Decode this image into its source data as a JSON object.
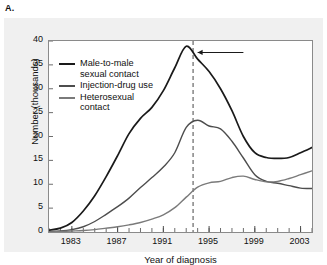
{
  "panel": {
    "label": "A."
  },
  "chart_data": {
    "type": "line",
    "title": "",
    "xlabel": "Year of diagnosis",
    "ylabel": "Number (thousands)",
    "xlim": [
      1981,
      2004
    ],
    "ylim": [
      0,
      40
    ],
    "yticks": [
      0,
      5,
      10,
      15,
      20,
      25,
      30,
      35,
      40
    ],
    "xticks_major": [
      1983,
      1987,
      1991,
      1995,
      1999,
      2003
    ],
    "xticks_minor_step": 1,
    "grid": false,
    "legend_position": "upper-left",
    "x": [
      1981,
      1982,
      1983,
      1984,
      1985,
      1986,
      1987,
      1988,
      1989,
      1990,
      1991,
      1992,
      1993,
      1994,
      1995,
      1996,
      1997,
      1998,
      1999,
      2000,
      2001,
      2002,
      2003,
      2004
    ],
    "series": [
      {
        "name": "Male-to-male sexual contact",
        "color": "#1a1a1a",
        "values": [
          0.4,
          0.8,
          2.0,
          4.4,
          7.6,
          11.6,
          16.0,
          20.6,
          23.8,
          26.1,
          29.6,
          34.4,
          38.9,
          36.2,
          33.6,
          30.0,
          25.4,
          20.0,
          16.6,
          15.6,
          15.4,
          15.6,
          16.6,
          17.7
        ]
      },
      {
        "name": "Injection-drug use",
        "color": "#4d4d4d",
        "values": [
          0.1,
          0.2,
          0.5,
          1.1,
          2.2,
          3.7,
          5.3,
          7.1,
          9.3,
          11.4,
          13.6,
          16.6,
          21.9,
          23.4,
          22.2,
          21.6,
          19.0,
          15.5,
          12.0,
          10.6,
          10.2,
          9.7,
          9.2,
          9.1
        ]
      },
      {
        "name": "Heterosexual contact",
        "color": "#7a7a7a",
        "values": [
          0.0,
          0.1,
          0.2,
          0.3,
          0.5,
          0.8,
          1.1,
          1.5,
          2.0,
          2.7,
          3.6,
          5.1,
          7.3,
          9.4,
          10.3,
          10.6,
          11.4,
          11.7,
          11.0,
          10.5,
          10.6,
          11.2,
          12.0,
          12.8
        ]
      }
    ],
    "annotations": [
      {
        "type": "vertical-dashed-line",
        "x": 1993.6,
        "color": "#666666"
      },
      {
        "type": "arrow",
        "direction": "left",
        "x_from": 1998.0,
        "x_to": 1994.0,
        "y": 37.6,
        "color": "#1a1a1a"
      }
    ]
  },
  "legend": {
    "entries": [
      {
        "label_line1": "Male-to-male",
        "label_line2": "sexual contact"
      },
      {
        "label_line1": "Injection-drug use",
        "label_line2": ""
      },
      {
        "label_line1": "Heterosexual",
        "label_line2": "contact"
      }
    ]
  }
}
